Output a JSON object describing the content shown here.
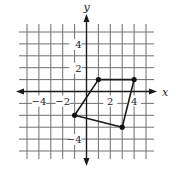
{
  "figure": {
    "axes": {
      "x_label": "x",
      "y_label": "y",
      "x_range": [
        -5,
        5
      ],
      "y_range": [
        -5,
        5
      ],
      "x_tick_labels": [
        {
          "value": -4,
          "text": "−4"
        },
        {
          "value": -2,
          "text": "−2"
        },
        {
          "value": 2,
          "text": "2"
        },
        {
          "value": 4,
          "text": "4"
        }
      ],
      "y_tick_labels": [
        {
          "value": 4,
          "text": "4"
        },
        {
          "value": 2,
          "text": "2"
        },
        {
          "value": -4,
          "text": "−4"
        }
      ],
      "grid": true
    },
    "polygon": {
      "name": "quadrilateral",
      "vertices": [
        {
          "x": 1,
          "y": 1
        },
        {
          "x": 4,
          "y": 1
        },
        {
          "x": 3,
          "y": -3
        },
        {
          "x": -1,
          "y": -2
        }
      ]
    },
    "colors": {
      "grid": "#6e6e6e",
      "axis": "#1a1a1a",
      "shape": "#1a1a1a",
      "background": "#ffffff"
    }
  }
}
